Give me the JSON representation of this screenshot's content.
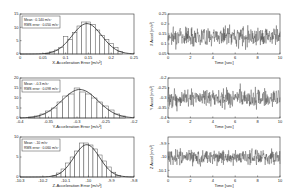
{
  "chart_data": [
    {
      "type": "bar",
      "title": "",
      "xlabel": "X-Acceleration Error [m/s²]",
      "ylabel": "",
      "xlim": [
        0,
        0.25
      ],
      "ylim": [
        0,
        15
      ],
      "xticks": [
        "0",
        "0.05",
        "0.1",
        "0.15",
        "0.2",
        "0.25"
      ],
      "yticks": [
        "0",
        "5",
        "10",
        "15"
      ],
      "legend": [
        "Mean : 0.140 m/s²",
        "RMS error : 0.050 m/s²"
      ],
      "bins_x": [
        0.06,
        0.07,
        0.08,
        0.09,
        0.1,
        0.11,
        0.12,
        0.13,
        0.14,
        0.15,
        0.16,
        0.17,
        0.18,
        0.19,
        0.2,
        0.21,
        0.22
      ],
      "values": [
        0.3,
        0.8,
        1.5,
        2.5,
        6.5,
        5.5,
        8,
        10.5,
        12,
        12,
        11,
        9,
        7,
        5.5,
        4,
        2.5,
        1
      ],
      "fit_curve": "gaussian"
    },
    {
      "type": "bar",
      "title": "",
      "xlabel": "Y-Acceleration Error [m/s²]",
      "ylabel": "",
      "xlim": [
        -0.4,
        -0.2
      ],
      "ylim": [
        0,
        20
      ],
      "xticks": [
        "-0.4",
        "-0.35",
        "-0.3",
        "-0.25",
        "-0.2"
      ],
      "yticks": [
        "0",
        "5",
        "10",
        "15",
        "20"
      ],
      "legend": [
        "Mean : -0.3 m/s²",
        "RMS error : 0.098 m/s²"
      ],
      "bins_x": [
        -0.38,
        -0.37,
        -0.36,
        -0.35,
        -0.34,
        -0.33,
        -0.32,
        -0.31,
        -0.3,
        -0.29,
        -0.28,
        -0.27,
        -0.26,
        -0.25,
        -0.24,
        -0.23,
        -0.22
      ],
      "values": [
        0.5,
        1,
        2,
        3.5,
        5,
        8,
        11,
        12,
        15,
        13,
        12,
        10,
        8,
        6,
        4,
        2,
        1
      ],
      "fit_curve": "gaussian"
    },
    {
      "type": "bar",
      "title": "",
      "xlabel": "Z-Acceleration Error [m/s²]",
      "ylabel": "",
      "xlim": [
        -10.3,
        -9.8
      ],
      "ylim": [
        0,
        10
      ],
      "xticks": [
        "-10.3",
        "-10.2",
        "-10.1",
        "-10",
        "-9.9",
        "-9.8"
      ],
      "yticks": [
        "0",
        "5",
        "10"
      ],
      "legend": [
        "Mean : -10 m/s²",
        "RMS error : 0.060 m/s²"
      ],
      "bins_x": [
        -10.15,
        -10.13,
        -10.11,
        -10.09,
        -10.07,
        -10.05,
        -10.03,
        -10.01,
        -9.99,
        -9.97,
        -9.95,
        -9.93,
        -9.91,
        -9.89,
        -9.87
      ],
      "values": [
        0.3,
        1,
        2,
        3.5,
        5,
        6.5,
        8.5,
        8.5,
        8,
        7,
        5.5,
        4,
        2.5,
        1.2,
        0.4
      ],
      "fit_curve": "gaussian"
    },
    {
      "type": "line",
      "title": "",
      "xlabel": "Time [sec]",
      "ylabel": "X Accel [m/s²]",
      "xlim": [
        0,
        10
      ],
      "ylim": [
        0.05,
        0.25
      ],
      "xticks": [
        "0",
        "2",
        "4",
        "6",
        "8",
        "10"
      ],
      "yticks": [
        "0.05",
        "0.1",
        "0.15",
        "0.2",
        "0.25"
      ],
      "mean": 0.14,
      "noise_amplitude": 0.05
    },
    {
      "type": "line",
      "title": "",
      "xlabel": "Time [sec]",
      "ylabel": "Y Accel [m/s²]",
      "xlim": [
        0,
        10
      ],
      "ylim": [
        -0.4,
        -0.2
      ],
      "xticks": [
        "0",
        "2",
        "4",
        "6",
        "8",
        "10"
      ],
      "yticks": [
        "-0.4",
        "-0.35",
        "-0.3",
        "-0.25",
        "-0.2"
      ],
      "mean": -0.3,
      "noise_amplitude": 0.05
    },
    {
      "type": "line",
      "title": "",
      "xlabel": "Time [sec]",
      "ylabel": "Z Accel [m/s²]",
      "xlim": [
        0,
        10
      ],
      "ylim": [
        -10.15,
        -9.85
      ],
      "xticks": [
        "0",
        "2",
        "4",
        "6",
        "8",
        "10"
      ],
      "yticks": [
        "-10.1",
        "-10",
        "-9.9",
        "-9.8"
      ],
      "mean": -10,
      "noise_amplitude": 0.06
    }
  ]
}
